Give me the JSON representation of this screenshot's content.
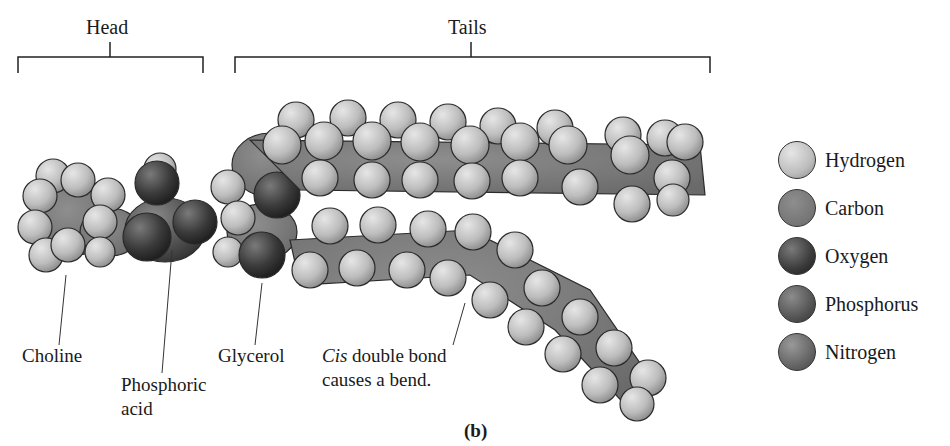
{
  "brackets": {
    "head": "Head",
    "tails": "Tails"
  },
  "labels": {
    "choline": "Choline",
    "phosphoric_acid_line1": "Phosphoric",
    "phosphoric_acid_line2": "acid",
    "glycerol": "Glycerol",
    "cis_italic": "Cis",
    "cis_line1_rest": " double bond",
    "cis_line2": "causes a bend."
  },
  "panel_label": "(b)",
  "legend": {
    "items": [
      {
        "label": "Hydrogen",
        "color": "#c4c4c4"
      },
      {
        "label": "Carbon",
        "color": "#7e7e7e"
      },
      {
        "label": "Oxygen",
        "color": "#4a4a4a"
      },
      {
        "label": "Phosphorus",
        "color": "#656565"
      },
      {
        "label": "Nitrogen",
        "color": "#747474"
      }
    ]
  },
  "colors": {
    "hydrogen": "#c4c4c4",
    "carbon": "#7e7e7e",
    "oxygen": "#3c3c3c",
    "phosphorus": "#5c5c5c",
    "nitrogen": "#6e6e6e"
  }
}
